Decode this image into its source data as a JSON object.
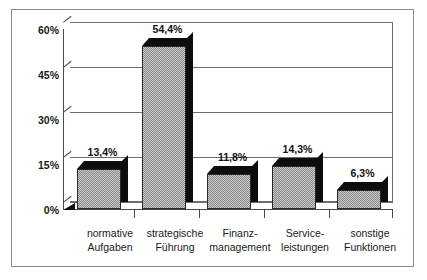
{
  "chart_data": {
    "type": "bar",
    "title": "",
    "subtitle": "",
    "xlabel": "",
    "ylabel": "",
    "categories": [
      "normative Aufgaben",
      "strategische Führung",
      "Finanz-management",
      "Service-leistungen",
      "sonstige Funktionen"
    ],
    "category_lines": [
      [
        "normative",
        "Aufgaben"
      ],
      [
        "strategische",
        "Führung"
      ],
      [
        "Finanz-",
        "management"
      ],
      [
        "Service-",
        "leistungen"
      ],
      [
        "sonstige",
        "Funktionen"
      ]
    ],
    "values": [
      13.4,
      54.4,
      11.8,
      14.3,
      6.3
    ],
    "value_labels": [
      "13,4%",
      "54,4%",
      "11,8%",
      "14,3%",
      "6,3%"
    ],
    "ylim": [
      0,
      60
    ],
    "yticks": [
      0,
      15,
      30,
      45,
      60
    ],
    "ytick_labels": [
      "0%",
      "15%",
      "30%",
      "45%",
      "60%"
    ],
    "grid": true,
    "legend": false,
    "legend_position": "none",
    "style": "3d-column",
    "colors": {
      "bar_face": "#a6a6a6",
      "bar_shadow": "#0d0d0d",
      "axis": "#4a4a4a",
      "gridline": "#6e6e6e",
      "frame": "#8d8d8d",
      "text": "#1a1a1a",
      "background": "#ffffff"
    }
  },
  "axis": {
    "y": {
      "ticks": [
        {
          "label": "60%",
          "value": 60
        },
        {
          "label": "45%",
          "value": 45
        },
        {
          "label": "30%",
          "value": 30
        },
        {
          "label": "15%",
          "value": 15
        },
        {
          "label": "0%",
          "value": 0
        }
      ]
    }
  },
  "bars": [
    {
      "category_line1": "normative",
      "category_line2": "Aufgaben",
      "value_label": "13,4%",
      "value": 13.4
    },
    {
      "category_line1": "strategische",
      "category_line2": "Führung",
      "value_label": "54,4%",
      "value": 54.4
    },
    {
      "category_line1": "Finanz-",
      "category_line2": "management",
      "value_label": "11,8%",
      "value": 11.8
    },
    {
      "category_line1": "Service-",
      "category_line2": "leistungen",
      "value_label": "14,3%",
      "value": 14.3
    },
    {
      "category_line1": "sonstige",
      "category_line2": "Funktionen",
      "value_label": "6,3%",
      "value": 6.3
    }
  ]
}
